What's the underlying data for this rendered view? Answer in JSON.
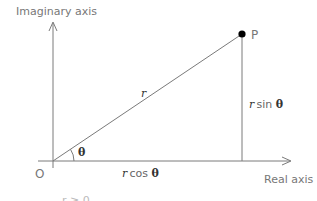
{
  "diagram": {
    "title_partial": "",
    "axes": {
      "imaginary_label": "Imaginary axis",
      "real_label": "Real axis",
      "origin_label": "O"
    },
    "point": {
      "label": "P"
    },
    "segments": {
      "radius_label": "r",
      "vertical_label_var": "r",
      "vertical_label_fn": "sin",
      "horizontal_label_var": "r",
      "horizontal_label_fn": "cos",
      "angle_symbol": "θ"
    },
    "footnote_partial": "r ≥ 0",
    "colors": {
      "line": "#7a7a7a",
      "point": "#000000",
      "label": "#777777",
      "math": "#333333"
    }
  }
}
